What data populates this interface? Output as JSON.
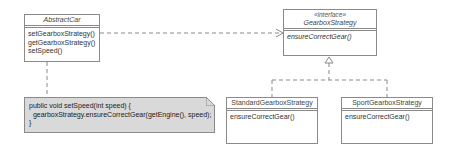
{
  "diagram": {
    "type": "UML class diagram",
    "classes": [
      {
        "name": "AbstractCar",
        "stereotype": "",
        "abstract": true,
        "operations": [
          "setGearboxStrategy()",
          "getGearboxStrategy()",
          "setSpeed()"
        ]
      },
      {
        "name": "GearboxStrategy",
        "stereotype": "«interface»",
        "abstract": true,
        "operations": [
          "ensureCorrectGear()"
        ]
      },
      {
        "name": "StandardGearboxStrategy",
        "stereotype": "",
        "abstract": false,
        "operations": [
          "ensureCorrectGear()"
        ]
      },
      {
        "name": "SportGearboxStrategy",
        "stereotype": "",
        "abstract": false,
        "operations": [
          "ensureCorrectGear()"
        ]
      }
    ],
    "note": {
      "lines": [
        "public void setSpeed(int speed) {",
        "  gearboxStrategy.ensureCorrectGear(getEngine(), speed);",
        "}"
      ]
    },
    "relations": [
      {
        "from": "AbstractCar",
        "to": "GearboxStrategy",
        "kind": "dependency"
      },
      {
        "from": "StandardGearboxStrategy",
        "to": "GearboxStrategy",
        "kind": "realization"
      },
      {
        "from": "SportGearboxStrategy",
        "to": "GearboxStrategy",
        "kind": "realization"
      },
      {
        "from": "note",
        "to": "AbstractCar",
        "kind": "note-anchor"
      }
    ],
    "colors": {
      "border": "#8a8a8a",
      "note_fill": "#d9d9d9",
      "class_fill": "#ffffff"
    }
  }
}
